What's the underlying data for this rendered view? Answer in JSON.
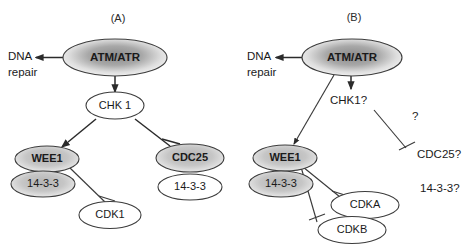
{
  "figure": {
    "panels": [
      {
        "id": "A",
        "label": "(A)",
        "nodes": {
          "atm": "ATM/ATR",
          "chk": "CHK 1",
          "wee1": "WEE1",
          "wee1_1433": "14-3-3",
          "cdc25": "CDC25",
          "cdc25_1433": "14-3-3",
          "cdk1": "CDK1"
        },
        "free_text": {
          "dna": "DNA",
          "repair": "repair"
        }
      },
      {
        "id": "B",
        "label": "(B)",
        "nodes": {
          "atm": "ATM/ATR",
          "wee1": "WEE1",
          "wee1_1433": "14-3-3",
          "cdka": "CDKA",
          "cdkb": "CDKB"
        },
        "free_text": {
          "dna": "DNA",
          "repair": "repair",
          "chk": "CHK1?",
          "question": "?",
          "cdc25": "CDC25?",
          "x1433": "14-3-3?"
        }
      }
    ],
    "colors": {
      "stroke": "#3c3c3c",
      "text": "#1a1a1a",
      "fill_white": "#ffffff",
      "fill_gray": "#c9c9c9",
      "gradient_center": "#8f8f8f",
      "gradient_edge": "#f2f2f2",
      "background": "#ffffff"
    }
  }
}
